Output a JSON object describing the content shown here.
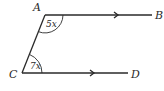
{
  "diagram": {
    "type": "parallel-lines-transversal",
    "points": {
      "A": "A",
      "B": "B",
      "C": "C",
      "D": "D"
    },
    "angles": {
      "at_A": "5x",
      "at_C": "7x"
    },
    "segments": [
      "AB",
      "CD",
      "AC"
    ],
    "parallel": [
      "AB",
      "CD"
    ],
    "colors": {
      "stroke": "#2a2a2a",
      "background": "#ffffff"
    }
  }
}
